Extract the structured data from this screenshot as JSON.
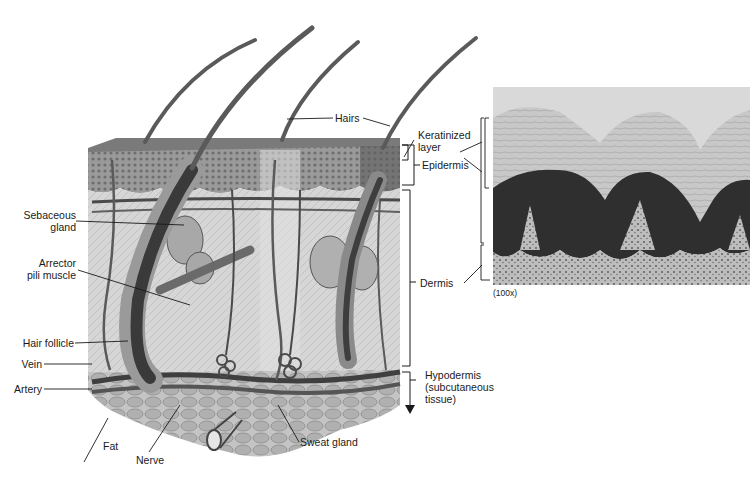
{
  "diagram": {
    "colors": {
      "background": "#ffffff",
      "epidermis": "#8a8a8a",
      "dermis": "#cfcfcf",
      "hypodermis_fat": "#b5b5b5",
      "hair": "#5a5a5a",
      "vessels": "#4a4a4a",
      "micrograph_light": "#c9c9c9",
      "micrograph_dark": "#2e2e2e",
      "label_text": "#1a1a1a"
    },
    "labels_left": [
      {
        "id": "sebaceous-gland",
        "lines": [
          "Sebaceous",
          "gland"
        ]
      },
      {
        "id": "arrector-pili-muscle",
        "lines": [
          "Arrector",
          "pili muscle"
        ]
      },
      {
        "id": "hair-follicle",
        "lines": [
          "Hair follicle"
        ]
      },
      {
        "id": "vein",
        "lines": [
          "Vein"
        ]
      },
      {
        "id": "artery",
        "lines": [
          "Artery"
        ]
      }
    ],
    "labels_top": [
      {
        "id": "hairs",
        "lines": [
          "Hairs"
        ]
      }
    ],
    "labels_right": [
      {
        "id": "keratinized-layer",
        "lines": [
          "Keratinized",
          "layer"
        ]
      },
      {
        "id": "epidermis",
        "lines": [
          "Epidermis"
        ]
      },
      {
        "id": "dermis",
        "lines": [
          "Dermis"
        ]
      },
      {
        "id": "hypodermis",
        "lines": [
          "Hypodermis",
          "(subcutaneous",
          "tissue)"
        ]
      }
    ],
    "labels_bottom": [
      {
        "id": "fat",
        "lines": [
          "Fat"
        ]
      },
      {
        "id": "nerve",
        "lines": [
          "Nerve"
        ]
      },
      {
        "id": "sweat-gland",
        "lines": [
          "Sweat gland"
        ]
      }
    ],
    "micrograph": {
      "magnification": "(100x)"
    }
  }
}
